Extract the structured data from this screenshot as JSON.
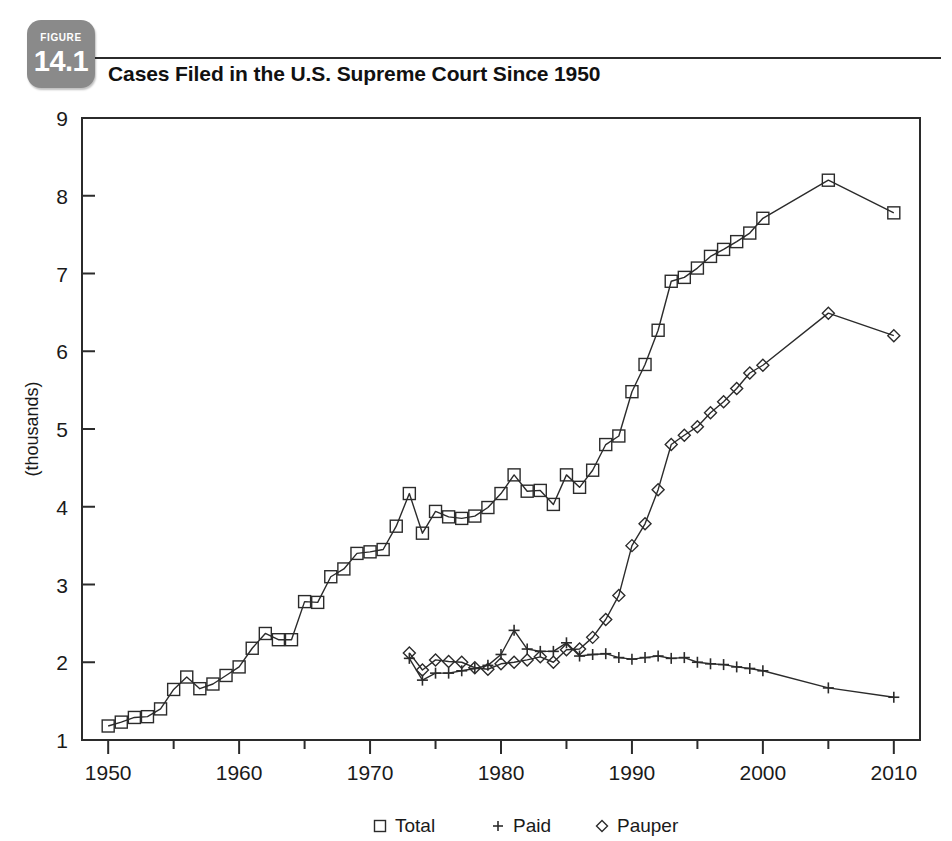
{
  "figure": {
    "badge_word": "FIGURE",
    "badge_number": "14.1",
    "title": "Cases Filed in the U.S. Supreme Court Since 1950"
  },
  "colors": {
    "ink": "#2b2b2b",
    "badge_gray": "#8a8a8a",
    "page_background": "#ffffff"
  },
  "chart_data": {
    "type": "line",
    "title": "Cases Filed in the U.S. Supreme Court Since 1950",
    "xlabel": "",
    "ylabel": "(thousands)",
    "xlim": [
      1948,
      2012
    ],
    "ylim": [
      1,
      9
    ],
    "grid": false,
    "legend_position": "bottom-center",
    "x_major_ticks": [
      1950,
      1960,
      1970,
      1980,
      1990,
      2000,
      2010
    ],
    "x_major_tick_labels": [
      "1950",
      "1960",
      "1970",
      "1980",
      "1990",
      "2000",
      "2010"
    ],
    "x_minor_ticks": [
      1955,
      1965,
      1975,
      1985,
      1995,
      2005
    ],
    "y_ticks": [
      1,
      2,
      3,
      4,
      5,
      6,
      7,
      8,
      9
    ],
    "y_tick_labels": [
      "1",
      "2",
      "3",
      "4",
      "5",
      "6",
      "7",
      "8",
      "9"
    ],
    "series": [
      {
        "name": "Total",
        "marker": "square",
        "x": [
          1950,
          1951,
          1952,
          1953,
          1954,
          1955,
          1956,
          1957,
          1958,
          1959,
          1960,
          1961,
          1962,
          1963,
          1964,
          1965,
          1966,
          1967,
          1968,
          1969,
          1970,
          1971,
          1972,
          1973,
          1974,
          1975,
          1976,
          1977,
          1978,
          1979,
          1980,
          1981,
          1982,
          1983,
          1984,
          1985,
          1986,
          1987,
          1988,
          1989,
          1990,
          1991,
          1992,
          1993,
          1994,
          1995,
          1996,
          1997,
          1998,
          1999,
          2000,
          2005,
          2010
        ],
        "values": [
          1.18,
          1.23,
          1.29,
          1.3,
          1.4,
          1.65,
          1.81,
          1.66,
          1.72,
          1.83,
          1.94,
          2.18,
          2.37,
          2.29,
          2.29,
          2.78,
          2.77,
          3.1,
          3.2,
          3.4,
          3.42,
          3.45,
          3.75,
          4.17,
          3.66,
          3.94,
          3.87,
          3.85,
          3.88,
          3.99,
          4.17,
          4.41,
          4.2,
          4.21,
          4.03,
          4.41,
          4.25,
          4.47,
          4.8,
          4.91,
          5.48,
          5.83,
          6.27,
          6.9,
          6.95,
          7.07,
          7.22,
          7.31,
          7.41,
          7.52,
          7.71,
          8.2,
          7.78
        ]
      },
      {
        "name": "Paid",
        "marker": "plus",
        "x": [
          1973,
          1974,
          1975,
          1976,
          1977,
          1978,
          1979,
          1980,
          1981,
          1982,
          1983,
          1984,
          1985,
          1986,
          1987,
          1988,
          1989,
          1990,
          1991,
          1992,
          1993,
          1994,
          1995,
          1996,
          1997,
          1998,
          1999,
          2000,
          2005,
          2010
        ],
        "values": [
          2.05,
          1.77,
          1.86,
          1.86,
          1.89,
          1.92,
          1.96,
          2.1,
          2.41,
          2.17,
          2.14,
          2.14,
          2.25,
          2.08,
          2.1,
          2.11,
          2.06,
          2.04,
          2.06,
          2.08,
          2.05,
          2.06,
          2.0,
          1.98,
          1.97,
          1.94,
          1.92,
          1.89,
          1.67,
          1.55
        ]
      },
      {
        "name": "Pauper",
        "marker": "diamond",
        "x": [
          1973,
          1974,
          1975,
          1976,
          1977,
          1978,
          1979,
          1980,
          1981,
          1982,
          1983,
          1984,
          1985,
          1986,
          1987,
          1988,
          1989,
          1990,
          1991,
          1992,
          1993,
          1994,
          1995,
          1996,
          1997,
          1998,
          1999,
          2000,
          2005,
          2010
        ],
        "values": [
          2.12,
          1.9,
          2.03,
          2.01,
          2.0,
          1.93,
          1.91,
          1.98,
          2.0,
          2.03,
          2.07,
          2.0,
          2.16,
          2.17,
          2.32,
          2.55,
          2.86,
          3.5,
          3.78,
          4.22,
          4.8,
          4.92,
          5.03,
          5.21,
          5.35,
          5.52,
          5.72,
          5.82,
          6.49,
          6.2
        ]
      }
    ],
    "legend": [
      {
        "label": "Total",
        "marker": "square"
      },
      {
        "label": "Paid",
        "marker": "plus"
      },
      {
        "label": "Pauper",
        "marker": "diamond"
      }
    ]
  }
}
